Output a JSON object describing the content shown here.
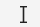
{
  "cursor": {
    "type": "text-i-beam",
    "color": "#222222",
    "background": "#f4f4f4"
  }
}
